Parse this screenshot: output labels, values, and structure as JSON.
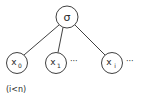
{
  "diagram": {
    "root": {
      "label": "σ",
      "cx": 67,
      "cy": 17,
      "r": 11
    },
    "children": [
      {
        "label": "x",
        "sub": "0",
        "cx": 17,
        "cy": 63,
        "r": 10.5,
        "ellipsis": ""
      },
      {
        "label": "x",
        "sub": "1",
        "cx": 56,
        "cy": 63,
        "r": 10.5,
        "ellipsis": "···"
      },
      {
        "label": "x",
        "sub": "i",
        "cx": 112,
        "cy": 63,
        "r": 10.5,
        "ellipsis": "···"
      }
    ],
    "condition": "(i<n)",
    "colors": {
      "stroke": "#2a2a2a",
      "background": "#ffffff"
    }
  }
}
